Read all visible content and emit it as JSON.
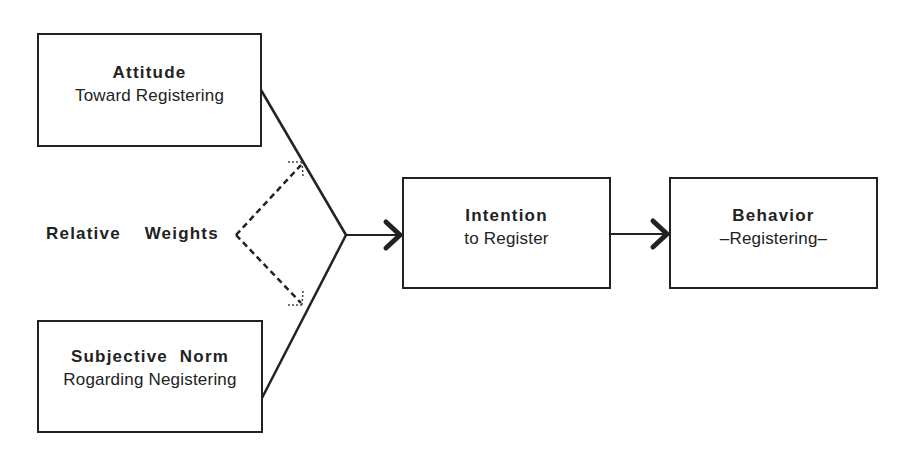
{
  "diagram": {
    "type": "flow-model",
    "nodes": {
      "attitude": {
        "title": "Attitude",
        "subtitle": "Toward Registering"
      },
      "subjective_norm": {
        "title": "Subjective  Norm",
        "subtitle": "Rogarding Negistering"
      },
      "intention": {
        "title": "Intention",
        "subtitle": "to Register"
      },
      "behavior": {
        "title": "Behavior",
        "subtitle": "–Registering–"
      }
    },
    "weights_label": "Relative  Weights",
    "edges": [
      {
        "from": "attitude",
        "to": "intention",
        "style": "solid"
      },
      {
        "from": "subjective_norm",
        "to": "intention",
        "style": "solid"
      },
      {
        "from": "intention",
        "to": "behavior",
        "style": "solid-arrow"
      },
      {
        "from": "relative_weights",
        "to": "attitude_edge",
        "style": "dashed-arrow"
      },
      {
        "from": "relative_weights",
        "to": "norm_edge",
        "style": "dashed-arrow"
      }
    ],
    "colors": {
      "stroke": "#222222",
      "background": "#ffffff"
    }
  }
}
